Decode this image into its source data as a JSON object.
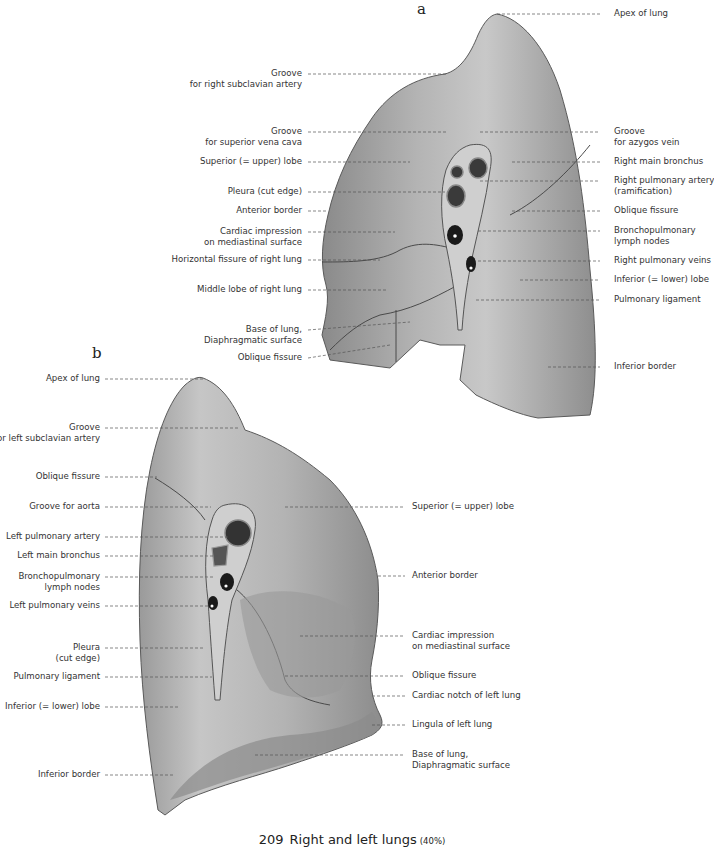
{
  "figure_a": {
    "letter": "a",
    "title": "Right lung (mediastinal view)",
    "left_labels": [
      {
        "lines": [
          "Groove",
          "for right subclavian artery"
        ]
      },
      {
        "lines": [
          "Groove",
          "for superior vena cava"
        ]
      },
      {
        "lines": [
          "Superior (= upper) lobe"
        ]
      },
      {
        "lines": [
          "Pleura (cut edge)"
        ]
      },
      {
        "lines": [
          "Anterior border"
        ]
      },
      {
        "lines": [
          "Cardiac impression",
          "on mediastinal surface"
        ]
      },
      {
        "lines": [
          "Horizontal fissure of right lung"
        ]
      },
      {
        "lines": [
          "Middle lobe of right lung"
        ]
      },
      {
        "lines": [
          "Base of lung,",
          "Diaphragmatic surface"
        ]
      },
      {
        "lines": [
          "Oblique fissure"
        ]
      }
    ],
    "right_labels": [
      {
        "lines": [
          "Apex of lung"
        ]
      },
      {
        "lines": [
          "Groove",
          "for azygos vein"
        ]
      },
      {
        "lines": [
          "Right main bronchus"
        ]
      },
      {
        "lines": [
          "Right pulmonary artery",
          "(ramification)"
        ]
      },
      {
        "lines": [
          "Oblique fissure"
        ]
      },
      {
        "lines": [
          "Bronchopulmonary",
          "lymph nodes"
        ]
      },
      {
        "lines": [
          "Right pulmonary veins"
        ]
      },
      {
        "lines": [
          "Inferior (= lower) lobe"
        ]
      },
      {
        "lines": [
          "Pulmonary ligament"
        ]
      },
      {
        "lines": [
          "Inferior border"
        ]
      }
    ]
  },
  "figure_b": {
    "letter": "b",
    "title": "Left lung (mediastinal view)",
    "left_labels": [
      {
        "lines": [
          "Apex of lung"
        ]
      },
      {
        "lines": [
          "Groove",
          "for left subclavian artery"
        ]
      },
      {
        "lines": [
          "Oblique fissure"
        ]
      },
      {
        "lines": [
          "Groove for aorta"
        ]
      },
      {
        "lines": [
          "Left pulmonary artery"
        ]
      },
      {
        "lines": [
          "Left main bronchus"
        ]
      },
      {
        "lines": [
          "Bronchopulmonary",
          "lymph nodes"
        ]
      },
      {
        "lines": [
          "Left pulmonary veins"
        ]
      },
      {
        "lines": [
          "Pleura",
          "(cut edge)"
        ]
      },
      {
        "lines": [
          "Pulmonary ligament"
        ]
      },
      {
        "lines": [
          "Inferior (= lower) lobe"
        ]
      },
      {
        "lines": [
          "Inferior border"
        ]
      }
    ],
    "right_labels": [
      {
        "lines": [
          "Superior (= upper) lobe"
        ]
      },
      {
        "lines": [
          "Anterior border"
        ]
      },
      {
        "lines": [
          "Cardiac impression",
          "on mediastinal surface"
        ]
      },
      {
        "lines": [
          "Oblique fissure"
        ]
      },
      {
        "lines": [
          "Cardiac notch of left lung"
        ]
      },
      {
        "lines": [
          "Lingula of left lung"
        ]
      },
      {
        "lines": [
          "Base of lung,",
          "Diaphragmatic surface"
        ]
      }
    ]
  },
  "caption": {
    "number": "209",
    "text": "Right and left lungs",
    "scale": "(40%)"
  },
  "colors": {
    "lung_fill": "#a9a9a9",
    "lung_light": "#cfcfcf",
    "lung_dark": "#6e6e6e",
    "hilum_dark": "#1e1e1e",
    "leader_line": "#555555",
    "text": "#333333"
  }
}
